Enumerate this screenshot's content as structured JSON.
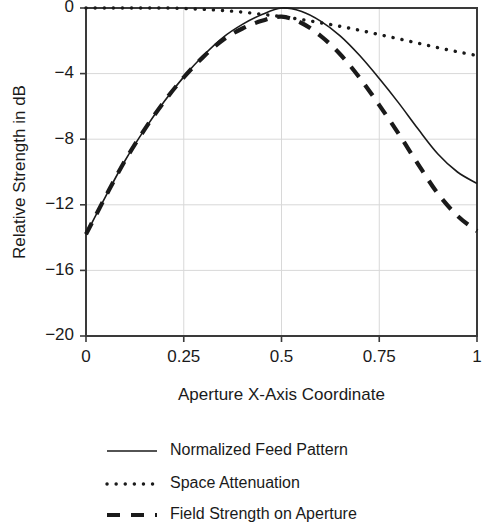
{
  "chart_data": {
    "type": "line",
    "title": "",
    "xlabel": "Aperture X-Axis Coordinate",
    "ylabel": "Relative Strength in dB",
    "xlim": [
      0,
      1
    ],
    "ylim": [
      -20,
      0
    ],
    "grid": true,
    "legend_position": "below",
    "xticks": [
      "0",
      "0.25",
      "0.5",
      "0.75",
      "1"
    ],
    "xtick_values": [
      0,
      0.25,
      0.5,
      0.75,
      1
    ],
    "yticks": [
      "0",
      "−4",
      "−8",
      "−12",
      "−16",
      "−20"
    ],
    "ytick_values": [
      0,
      -4,
      -8,
      -12,
      -16,
      -20
    ],
    "x": [
      0,
      0.05,
      0.1,
      0.15,
      0.2,
      0.25,
      0.3,
      0.35,
      0.4,
      0.45,
      0.5,
      0.55,
      0.6,
      0.65,
      0.7,
      0.75,
      0.8,
      0.85,
      0.9,
      0.95,
      1.0
    ],
    "series": [
      {
        "name": "Normalized Feed Pattern",
        "style": "solid",
        "values": [
          -13.8,
          -11.5,
          -9.3,
          -7.4,
          -5.7,
          -4.2,
          -2.9,
          -1.8,
          -1.0,
          -0.4,
          0.0,
          -0.2,
          -0.8,
          -1.7,
          -2.9,
          -4.3,
          -5.8,
          -7.4,
          -8.9,
          -10.0,
          -10.7
        ]
      },
      {
        "name": "Space Attenuation",
        "style": "dotted",
        "values": [
          0.0,
          0.0,
          0.0,
          0.0,
          0.0,
          -0.03,
          -0.08,
          -0.15,
          -0.25,
          -0.38,
          -0.53,
          -0.7,
          -0.9,
          -1.12,
          -1.36,
          -1.62,
          -1.88,
          -2.15,
          -2.42,
          -2.67,
          -2.9
        ]
      },
      {
        "name": "Field Strength on Aperture",
        "style": "dashed",
        "values": [
          -13.8,
          -11.5,
          -9.3,
          -7.4,
          -5.7,
          -4.23,
          -2.98,
          -1.95,
          -1.25,
          -0.78,
          -0.53,
          -0.9,
          -1.7,
          -2.82,
          -4.26,
          -5.92,
          -7.68,
          -9.55,
          -11.32,
          -12.67,
          -13.6
        ]
      }
    ],
    "legend": [
      {
        "label": "Normalized Feed Pattern",
        "style": "solid"
      },
      {
        "label": "Space Attenuation",
        "style": "dotted"
      },
      {
        "label": "Field Strength on Aperture",
        "style": "dashed"
      }
    ]
  }
}
